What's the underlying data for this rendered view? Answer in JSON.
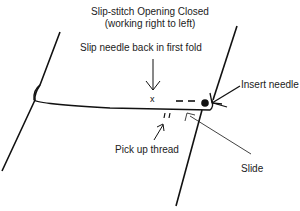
{
  "diagram": {
    "title_line1": "Slip-stitch Opening Closed",
    "title_line2": "(working right to left)",
    "labels": {
      "slip_needle": "Slip needle back in first fold",
      "insert_needle": "Insert needle",
      "pick_up_thread": "Pick up thread",
      "slide": "Slide"
    },
    "marks": {
      "x_mark": "x"
    },
    "colors": {
      "line": "#111111",
      "text": "#222222",
      "background": "#ffffff"
    }
  }
}
